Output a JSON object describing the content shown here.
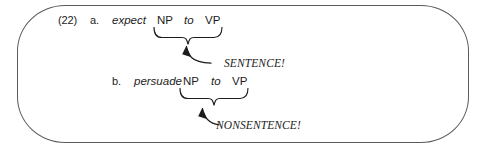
{
  "figure": {
    "example_number": "(22)",
    "border_color": "#5b5b5b",
    "text_color": "#1c1c1c",
    "items": [
      {
        "letter": "a.",
        "verb": "expect",
        "tokens": [
          "NP",
          "to",
          "VP"
        ],
        "brace_label": "SENTENCE!"
      },
      {
        "letter": "b.",
        "verb": "persuade",
        "tokens": [
          "NP",
          "to",
          "VP"
        ],
        "brace_label": "NONSENTENCE!"
      }
    ]
  }
}
